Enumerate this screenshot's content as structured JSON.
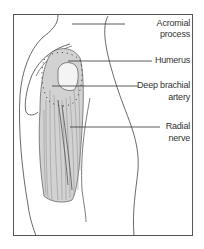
{
  "figure": {
    "labels": {
      "acromial_process": "Acromial process",
      "humerus": "Humerus",
      "deep_brachial_artery_line1": "Deep brachial",
      "deep_brachial_artery_line2": "artery",
      "radial_nerve_line1": "Radial",
      "radial_nerve_line2": "nerve"
    },
    "colors": {
      "frame": "#555555",
      "line": "#444444",
      "muscle_shade": "#9a9a9a"
    }
  }
}
